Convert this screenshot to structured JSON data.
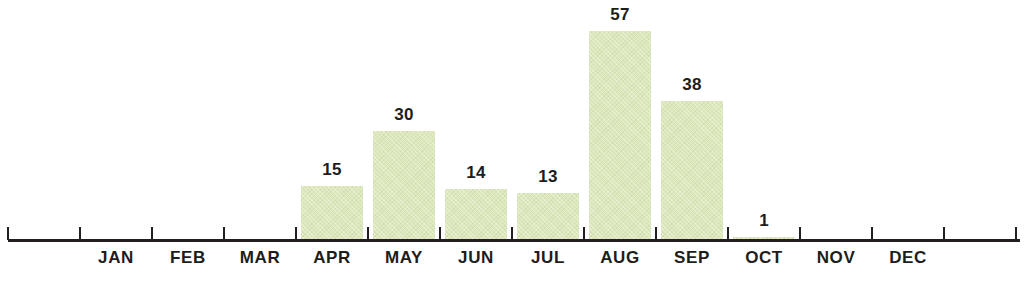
{
  "chart_data": {
    "type": "bar",
    "title": "",
    "subtitle": "",
    "xlabel": "",
    "ylabel": "",
    "categories": [
      "JAN",
      "FEB",
      "MAR",
      "APR",
      "MAY",
      "JUN",
      "JUL",
      "AUG",
      "SEP",
      "OCT",
      "NOV",
      "DEC"
    ],
    "values": [
      0,
      0,
      0,
      15,
      30,
      14,
      13,
      57,
      38,
      1,
      0,
      0
    ],
    "value_labels": [
      "",
      "",
      "",
      "15",
      "30",
      "14",
      "13",
      "57",
      "38",
      "1",
      "",
      ""
    ],
    "series": [
      {
        "name": "",
        "values": [
          0,
          0,
          0,
          15,
          30,
          14,
          13,
          57,
          38,
          1,
          0,
          0
        ]
      }
    ],
    "ylim": [
      0,
      57
    ],
    "grid": false,
    "legend": false,
    "legend_position": "none",
    "annotations": [],
    "bar_color": "#dce8bb",
    "axis_color": "#231f20",
    "label_color": "#1d1d1b",
    "background_color": "#ffffff"
  },
  "axis": {
    "ticks": [
      8,
      80,
      152,
      224,
      296,
      368,
      440,
      512,
      584,
      656,
      728,
      800,
      872,
      944,
      1016
    ]
  }
}
